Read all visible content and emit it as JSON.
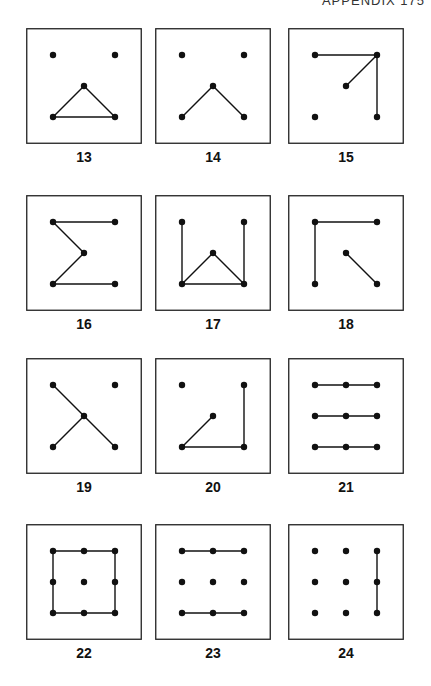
{
  "page": {
    "running_head": "APPENDIX 175"
  },
  "figures": [
    {
      "label": "13",
      "dots": [
        [
          0,
          0
        ],
        [
          2,
          0
        ],
        [
          1,
          1
        ],
        [
          0,
          2
        ],
        [
          2,
          2
        ]
      ],
      "lines": [
        [
          [
            1,
            1
          ],
          [
            0,
            2
          ]
        ],
        [
          [
            1,
            1
          ],
          [
            2,
            2
          ]
        ],
        [
          [
            0,
            2
          ],
          [
            2,
            2
          ]
        ]
      ]
    },
    {
      "label": "14",
      "dots": [
        [
          0,
          0
        ],
        [
          2,
          0
        ],
        [
          1,
          1
        ],
        [
          0,
          2
        ],
        [
          2,
          2
        ]
      ],
      "lines": [
        [
          [
            1,
            1
          ],
          [
            0,
            2
          ]
        ],
        [
          [
            1,
            1
          ],
          [
            2,
            2
          ]
        ]
      ]
    },
    {
      "label": "15",
      "dots": [
        [
          0,
          0
        ],
        [
          2,
          0
        ],
        [
          1,
          1
        ],
        [
          0,
          2
        ],
        [
          2,
          2
        ]
      ],
      "lines": [
        [
          [
            0,
            0
          ],
          [
            2,
            0
          ]
        ],
        [
          [
            2,
            0
          ],
          [
            1,
            1
          ]
        ],
        [
          [
            2,
            0
          ],
          [
            2,
            2
          ]
        ]
      ]
    },
    {
      "label": "16",
      "dots": [
        [
          0,
          0
        ],
        [
          2,
          0
        ],
        [
          1,
          1
        ],
        [
          0,
          2
        ],
        [
          2,
          2
        ]
      ],
      "lines": [
        [
          [
            0,
            0
          ],
          [
            2,
            0
          ]
        ],
        [
          [
            0,
            0
          ],
          [
            1,
            1
          ]
        ],
        [
          [
            1,
            1
          ],
          [
            0,
            2
          ]
        ],
        [
          [
            0,
            2
          ],
          [
            2,
            2
          ]
        ]
      ]
    },
    {
      "label": "17",
      "dots": [
        [
          0,
          0
        ],
        [
          2,
          0
        ],
        [
          1,
          1
        ],
        [
          0,
          2
        ],
        [
          2,
          2
        ]
      ],
      "lines": [
        [
          [
            0,
            0
          ],
          [
            0,
            2
          ]
        ],
        [
          [
            2,
            0
          ],
          [
            2,
            2
          ]
        ],
        [
          [
            1,
            1
          ],
          [
            0,
            2
          ]
        ],
        [
          [
            1,
            1
          ],
          [
            2,
            2
          ]
        ],
        [
          [
            0,
            2
          ],
          [
            2,
            2
          ]
        ]
      ]
    },
    {
      "label": "18",
      "dots": [
        [
          0,
          0
        ],
        [
          2,
          0
        ],
        [
          1,
          1
        ],
        [
          0,
          2
        ],
        [
          2,
          2
        ]
      ],
      "lines": [
        [
          [
            0,
            0
          ],
          [
            2,
            0
          ]
        ],
        [
          [
            0,
            0
          ],
          [
            0,
            2
          ]
        ],
        [
          [
            1,
            1
          ],
          [
            2,
            2
          ]
        ]
      ]
    },
    {
      "label": "19",
      "dots": [
        [
          0,
          0
        ],
        [
          2,
          0
        ],
        [
          1,
          1
        ],
        [
          0,
          2
        ],
        [
          2,
          2
        ]
      ],
      "lines": [
        [
          [
            0,
            0
          ],
          [
            1,
            1
          ]
        ],
        [
          [
            1,
            1
          ],
          [
            2,
            2
          ]
        ],
        [
          [
            1,
            1
          ],
          [
            0,
            2
          ]
        ]
      ]
    },
    {
      "label": "20",
      "dots": [
        [
          0,
          0
        ],
        [
          2,
          0
        ],
        [
          1,
          1
        ],
        [
          0,
          2
        ],
        [
          2,
          2
        ]
      ],
      "lines": [
        [
          [
            1,
            1
          ],
          [
            0,
            2
          ]
        ],
        [
          [
            0,
            2
          ],
          [
            2,
            2
          ]
        ],
        [
          [
            2,
            0
          ],
          [
            2,
            2
          ]
        ]
      ]
    },
    {
      "label": "21",
      "dots": [
        [
          0,
          0
        ],
        [
          1,
          0
        ],
        [
          2,
          0
        ],
        [
          0,
          1
        ],
        [
          1,
          1
        ],
        [
          2,
          1
        ],
        [
          0,
          2
        ],
        [
          1,
          2
        ],
        [
          2,
          2
        ]
      ],
      "lines": [
        [
          [
            0,
            0
          ],
          [
            2,
            0
          ]
        ],
        [
          [
            0,
            1
          ],
          [
            2,
            1
          ]
        ],
        [
          [
            0,
            2
          ],
          [
            2,
            2
          ]
        ]
      ]
    },
    {
      "label": "22",
      "dots": [
        [
          0,
          0
        ],
        [
          1,
          0
        ],
        [
          2,
          0
        ],
        [
          0,
          1
        ],
        [
          1,
          1
        ],
        [
          2,
          1
        ],
        [
          0,
          2
        ],
        [
          1,
          2
        ],
        [
          2,
          2
        ]
      ],
      "lines": [
        [
          [
            0,
            0
          ],
          [
            2,
            0
          ]
        ],
        [
          [
            2,
            0
          ],
          [
            2,
            2
          ]
        ],
        [
          [
            2,
            2
          ],
          [
            0,
            2
          ]
        ],
        [
          [
            0,
            2
          ],
          [
            0,
            0
          ]
        ]
      ]
    },
    {
      "label": "23",
      "dots": [
        [
          0,
          0
        ],
        [
          1,
          0
        ],
        [
          2,
          0
        ],
        [
          0,
          1
        ],
        [
          1,
          1
        ],
        [
          2,
          1
        ],
        [
          0,
          2
        ],
        [
          1,
          2
        ],
        [
          2,
          2
        ]
      ],
      "lines": [
        [
          [
            0,
            0
          ],
          [
            2,
            0
          ]
        ],
        [
          [
            0,
            2
          ],
          [
            2,
            2
          ]
        ]
      ]
    },
    {
      "label": "24",
      "dots": [
        [
          0,
          0
        ],
        [
          1,
          0
        ],
        [
          2,
          0
        ],
        [
          0,
          1
        ],
        [
          1,
          1
        ],
        [
          2,
          1
        ],
        [
          0,
          2
        ],
        [
          1,
          2
        ],
        [
          2,
          2
        ]
      ],
      "lines": [
        [
          [
            2,
            0
          ],
          [
            2,
            2
          ]
        ]
      ]
    }
  ]
}
